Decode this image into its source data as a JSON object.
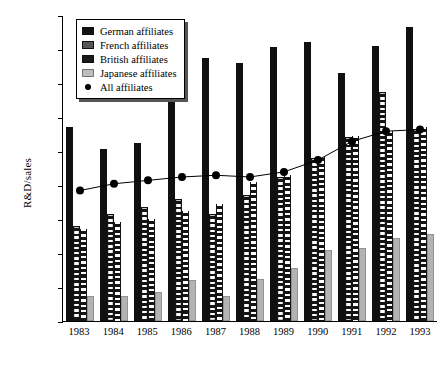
{
  "chart_data": {
    "type": "bar",
    "title": "",
    "xlabel": "",
    "ylabel": "R&D/sales",
    "categories": [
      "1983",
      "1984",
      "1985",
      "1986",
      "1987",
      "1988",
      "1989",
      "1990",
      "1991",
      "1992",
      "1993"
    ],
    "ylim": [
      0,
      1.8
    ],
    "ytick_values": [
      0,
      0.2,
      0.4,
      0.6,
      0.8,
      1.0,
      1.2,
      1.4,
      1.6,
      1.8
    ],
    "ytick_labels": [
      "0.00%",
      "0.20%",
      "0.40%",
      "0.60%",
      "0.80%",
      "1.00%",
      "1.20%",
      "1.40%",
      "1.60%",
      "1.80%"
    ],
    "grid": false,
    "legend_position": "top-left",
    "units": "percent",
    "series": [
      {
        "name": "German affiliates",
        "type": "bar",
        "values": [
          1.14,
          1.01,
          1.05,
          1.34,
          1.55,
          1.52,
          1.61,
          1.64,
          1.46,
          1.62,
          1.73
        ]
      },
      {
        "name": "French affiliates",
        "type": "bar",
        "values": [
          0.56,
          0.63,
          0.67,
          0.72,
          0.63,
          0.74,
          0.85,
          0.96,
          1.08,
          1.35,
          1.13
        ]
      },
      {
        "name": "British affiliates",
        "type": "bar",
        "values": [
          0.54,
          0.58,
          0.6,
          0.65,
          0.69,
          0.82,
          0.86,
          0.97,
          1.09,
          1.12,
          1.14
        ]
      },
      {
        "name": "Japanese affiliates",
        "type": "bar",
        "values": [
          0.15,
          0.15,
          0.17,
          0.24,
          0.15,
          0.25,
          0.31,
          0.42,
          0.43,
          0.49,
          0.51
        ]
      },
      {
        "name": "All affiliates",
        "type": "line",
        "values": [
          0.77,
          0.81,
          0.83,
          0.85,
          0.86,
          0.85,
          0.88,
          0.95,
          1.06,
          1.12,
          1.13
        ]
      }
    ]
  },
  "legend": {
    "items": [
      {
        "label": "German affiliates",
        "swatch": "german-swatch"
      },
      {
        "label": "French affiliates",
        "swatch": "french-swatch"
      },
      {
        "label": "British affiliates",
        "swatch": "british-swatch"
      },
      {
        "label": "Japanese affiliates",
        "swatch": "japanese-swatch"
      },
      {
        "label": "All affiliates",
        "swatch": "all-affiliates-marker"
      }
    ]
  },
  "colors": {
    "german": "#101010",
    "french": "#141414",
    "british": "#141414",
    "japanese": "#b3b3b3",
    "line": "#000000",
    "axis": "#000000",
    "background": "#ffffff"
  }
}
